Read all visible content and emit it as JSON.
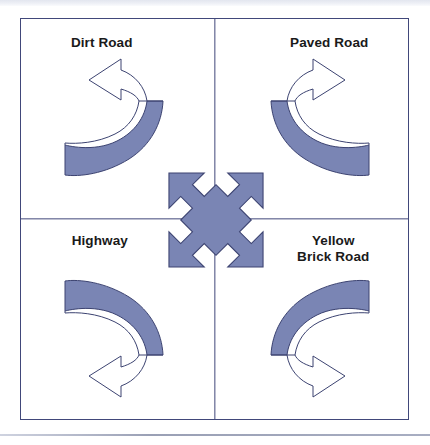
{
  "diagram": {
    "colors": {
      "frame_line": "#41487a",
      "arrow_fill": "#7a85b4",
      "arrow_outline": "#3c4371",
      "arrow_white": "#ffffff",
      "label_text": "#1a1a1a",
      "page_background": "#ffffff"
    },
    "quadrants": [
      {
        "position": "top-left",
        "label": "Dirt Road",
        "icon": "curved-arrow-counterclockwise-icon",
        "arrow_direction": "left"
      },
      {
        "position": "top-right",
        "label": "Paved Road",
        "icon": "curved-arrow-clockwise-icon",
        "arrow_direction": "right"
      },
      {
        "position": "bottom-left",
        "label": "Highway",
        "icon": "curved-arrow-down-left-icon",
        "arrow_direction": "left"
      },
      {
        "position": "bottom-right",
        "label_line1": "Yellow",
        "label_line2": "Brick Road",
        "label": "Yellow Brick Road",
        "icon": "curved-arrow-down-right-icon",
        "arrow_direction": "right"
      }
    ],
    "center": {
      "icon": "four-way-diagonal-arrow-icon",
      "label": ""
    }
  }
}
